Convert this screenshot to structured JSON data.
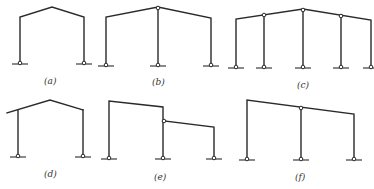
{
  "figure": {
    "line_color": "#2a2a2a",
    "panels": [
      {
        "id": "a",
        "caption": "(a)",
        "type": "single-span gable frame",
        "spans": 1,
        "internal_hinges": 0,
        "pinned_supports": 2
      },
      {
        "id": "b",
        "caption": "(b)",
        "type": "two-span gable frame with hinged center column",
        "spans": 2,
        "internal_hinges": 1,
        "pinned_supports": 3
      },
      {
        "id": "c",
        "caption": "(c)",
        "type": "four-span gable frame with hinged interior columns",
        "spans": 4,
        "internal_hinges": 3,
        "pinned_supports": 5
      },
      {
        "id": "d",
        "caption": "(d)",
        "type": "single-span gable frame with cantilever eave",
        "spans": 1,
        "internal_hinges": 0,
        "pinned_supports": 2
      },
      {
        "id": "e",
        "caption": "(e)",
        "type": "stepped two-span frame with hinged lower rafter",
        "spans": 2,
        "internal_hinges": 1,
        "pinned_supports": 3
      },
      {
        "id": "f",
        "caption": "(f)",
        "type": "two-span mono-pitch frame with hinged center column",
        "spans": 2,
        "internal_hinges": 1,
        "pinned_supports": 3
      }
    ]
  }
}
